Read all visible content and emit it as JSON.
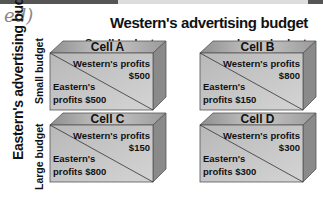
{
  "title": "Western's advertising budget",
  "columns": [
    "Small budget",
    "Large budget"
  ],
  "side_title": "Eastern's advertising budget",
  "rows": [
    "Small budget",
    "Large budget"
  ],
  "scribble_text": "ed)",
  "cells": [
    {
      "name": "Cell A",
      "western_label": "Western's profits",
      "western_value": "$500",
      "eastern_label": "Eastern's",
      "eastern_value": "profits $500"
    },
    {
      "name": "Cell B",
      "western_label": "Western's profits",
      "western_value": "$800",
      "eastern_label": "Eastern's",
      "eastern_value": "profits $150"
    },
    {
      "name": "Cell C",
      "western_label": "Western's profits",
      "western_value": "$150",
      "eastern_label": "Eastern's",
      "eastern_value": "profits $800"
    },
    {
      "name": "Cell D",
      "western_label": "Western's profits",
      "western_value": "$300",
      "eastern_label": "Eastern's",
      "eastern_value": "profits $300"
    }
  ],
  "colors": {
    "top_face": "#a8a8a8",
    "front_face": "#bdbdbd",
    "side_face": "#8a8a8a",
    "outline": "#555555"
  }
}
